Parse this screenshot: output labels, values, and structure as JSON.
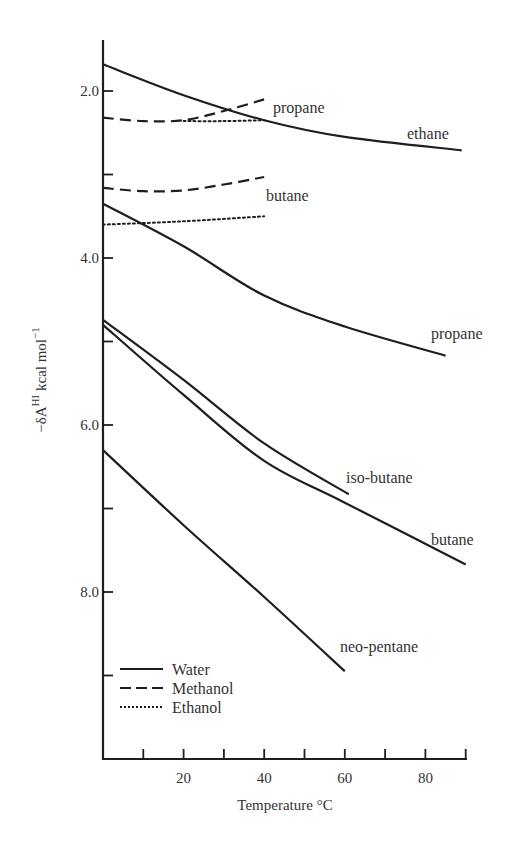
{
  "chart_data": {
    "type": "line",
    "title": "",
    "xlabel": "Temperature °C",
    "ylabel": "-δA^HI kcal mol^-1",
    "ylabel_main": "−δA",
    "ylabel_sup": "HI",
    "ylabel_unit": " kcal mol",
    "ylabel_unit_sup": "−1",
    "xlim": [
      0,
      90
    ],
    "ylim": [
      10.0,
      1.4
    ],
    "y_inverted": true,
    "grid": false,
    "x_ticks": [
      10,
      20,
      30,
      40,
      50,
      60,
      70,
      80,
      90
    ],
    "x_tick_labels": [
      {
        "x": 20,
        "label": "20"
      },
      {
        "x": 40,
        "label": "40"
      },
      {
        "x": 60,
        "label": "60"
      },
      {
        "x": 80,
        "label": "80"
      }
    ],
    "y_ticks": [
      2.0,
      3.0,
      4.0,
      5.0,
      6.0,
      7.0,
      8.0,
      9.0
    ],
    "y_tick_labels": [
      {
        "y": 2.0,
        "label": "2.0"
      },
      {
        "y": 4.0,
        "label": "4.0"
      },
      {
        "y": 6.0,
        "label": "6.0"
      },
      {
        "y": 8.0,
        "label": "8.0"
      }
    ],
    "legend": {
      "position": "lower-left",
      "entries": [
        {
          "label": "Water",
          "style": "solid"
        },
        {
          "label": "Methanol",
          "style": "dashed"
        },
        {
          "label": "Ethanol",
          "style": "dotted"
        }
      ]
    },
    "series": [
      {
        "name": "ethane (Water)",
        "solvent": "Water",
        "style": "solid",
        "label": "ethane",
        "x": [
          0,
          20,
          40,
          60,
          89
        ],
        "y": [
          1.68,
          2.05,
          2.35,
          2.55,
          2.71
        ],
        "label_pos": [
          407,
          139
        ]
      },
      {
        "name": "propane (Methanol)",
        "solvent": "Methanol",
        "style": "dashed",
        "label": "propane",
        "x": [
          0,
          10,
          20,
          30,
          40
        ],
        "y": [
          2.32,
          2.36,
          2.35,
          2.24,
          2.1
        ],
        "label_pos": [
          273,
          113
        ]
      },
      {
        "name": "propane (Ethanol)",
        "solvent": "Ethanol",
        "style": "dotted",
        "label": "",
        "x": [
          20,
          30,
          40
        ],
        "y": [
          2.36,
          2.36,
          2.35
        ]
      },
      {
        "name": "butane (Methanol)",
        "solvent": "Methanol",
        "style": "dashed",
        "label": "butane",
        "x": [
          0,
          10,
          20,
          30,
          40
        ],
        "y": [
          3.16,
          3.2,
          3.19,
          3.12,
          3.03
        ],
        "label_pos": [
          266,
          201
        ]
      },
      {
        "name": "butane (Ethanol)",
        "solvent": "Ethanol",
        "style": "dotted",
        "label": "",
        "x": [
          0,
          20,
          40
        ],
        "y": [
          3.6,
          3.56,
          3.5
        ]
      },
      {
        "name": "propane (Water)",
        "solvent": "Water",
        "style": "solid",
        "label": "propane",
        "x": [
          0,
          20,
          40,
          60,
          85
        ],
        "y": [
          3.35,
          3.86,
          4.45,
          4.82,
          5.17
        ],
        "label_pos": [
          431,
          339
        ]
      },
      {
        "name": "iso-butane (Water)",
        "solvent": "Water",
        "style": "solid",
        "label": "iso-butane",
        "x": [
          0,
          20,
          40,
          61
        ],
        "y": [
          4.74,
          5.46,
          6.22,
          6.83
        ],
        "label_pos": [
          346,
          483
        ]
      },
      {
        "name": "butane (Water)",
        "solvent": "Water",
        "style": "solid",
        "label": "butane",
        "x": [
          0,
          20,
          40,
          60,
          90
        ],
        "y": [
          4.8,
          5.64,
          6.43,
          6.93,
          7.67
        ],
        "label_pos": [
          431,
          545
        ]
      },
      {
        "name": "neo-pentane (Water)",
        "solvent": "Water",
        "style": "solid",
        "label": "neo-pentane",
        "x": [
          0,
          20,
          40,
          60
        ],
        "y": [
          6.3,
          7.2,
          8.06,
          8.95
        ],
        "label_pos": [
          340,
          652
        ]
      }
    ]
  },
  "colors": {
    "line": "#1e1e1e",
    "text": "#333333",
    "background": "#ffffff"
  }
}
